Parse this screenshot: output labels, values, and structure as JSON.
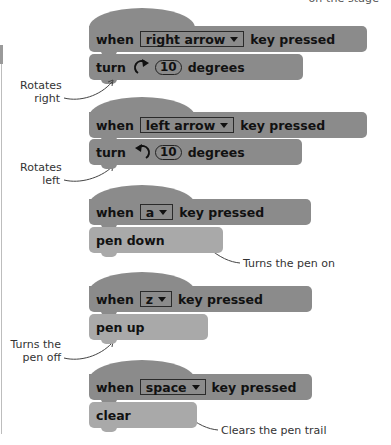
{
  "caption_top": "on the stage",
  "colors": {
    "event_block": "#8b8b8b",
    "motion_block": "#8b8b8b",
    "pen_block": "#a9a9a9",
    "text": "#111111",
    "annotation_text": "#333333"
  },
  "scripts": [
    {
      "hat": {
        "when": "when",
        "key": "right arrow",
        "pressed": "key pressed"
      },
      "action": {
        "type": "motion",
        "label": "turn",
        "icon": "rotate-clockwise-icon",
        "value": "10",
        "suffix": "degrees"
      },
      "annotation": {
        "line1": "Rotates",
        "line2": "right"
      }
    },
    {
      "hat": {
        "when": "when",
        "key": "left arrow",
        "pressed": "key pressed"
      },
      "action": {
        "type": "motion",
        "label": "turn",
        "icon": "rotate-counterclockwise-icon",
        "value": "10",
        "suffix": "degrees"
      },
      "annotation": {
        "line1": "Rotates",
        "line2": "left"
      }
    },
    {
      "hat": {
        "when": "when",
        "key": "a",
        "pressed": "key pressed"
      },
      "action": {
        "type": "pen",
        "label": "pen down"
      },
      "annotation": {
        "line1": "Turns the pen on"
      }
    },
    {
      "hat": {
        "when": "when",
        "key": "z",
        "pressed": "key pressed"
      },
      "action": {
        "type": "pen",
        "label": "pen up"
      },
      "annotation": {
        "line1": "Turns the",
        "line2": "pen off"
      }
    },
    {
      "hat": {
        "when": "when",
        "key": "space",
        "pressed": "key pressed"
      },
      "action": {
        "type": "pen",
        "label": "clear"
      },
      "annotation": {
        "line1": "Clears the pen trail"
      }
    }
  ]
}
